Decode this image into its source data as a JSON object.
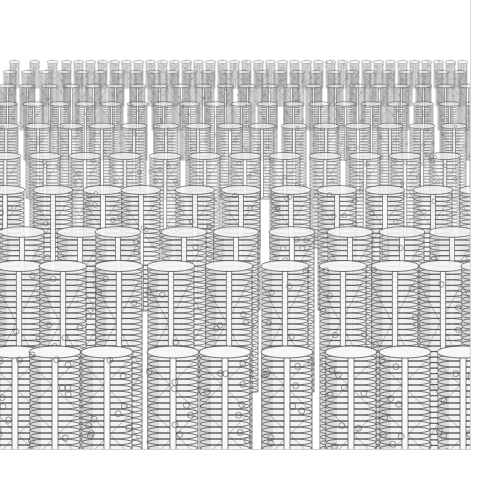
{
  "image": {
    "description": "Perspective field of helical pillar columns (rendered structural illustration)",
    "width": 504,
    "height": 492,
    "scene_bounds": {
      "x": 0,
      "y": 0,
      "width": 471,
      "height": 450
    },
    "background": "#ffffff",
    "frame_color": "#d0d0d0"
  },
  "scene": {
    "horizon_y": 62,
    "vanishing_x": 235,
    "stroke_color": "#3a3a3a",
    "light_fill": "#f2f2f2",
    "shadow_fill": "#cfcfcf",
    "bead_color": "#555555",
    "rows": [
      {
        "y_top": 62,
        "height": 26,
        "width": 9,
        "opacity": 0.45,
        "xs": [
          10,
          30,
          48,
          62,
          74,
          86,
          98,
          110,
          122,
          134,
          146,
          158,
          170,
          182,
          194,
          206,
          218,
          230,
          242,
          254,
          266,
          278,
          290,
          302,
          314,
          326,
          338,
          350,
          362,
          374,
          386,
          398,
          410,
          422,
          434,
          446,
          458
        ]
      },
      {
        "y_top": 72,
        "height": 34,
        "width": 12,
        "opacity": 0.5,
        "xs": [
          4,
          22,
          40,
          58,
          76,
          94,
          112,
          130,
          148,
          166,
          184,
          202,
          220,
          238,
          256,
          274,
          292,
          310,
          328,
          346,
          364,
          382,
          400,
          418,
          436,
          454
        ]
      },
      {
        "y_top": 86,
        "height": 44,
        "width": 15,
        "opacity": 0.55,
        "xs": [
          0,
          20,
          42,
          64,
          86,
          108,
          130,
          152,
          174,
          196,
          218,
          240,
          262,
          284,
          306,
          328,
          350,
          372,
          394,
          416,
          438,
          460
        ]
      },
      {
        "y_top": 104,
        "height": 56,
        "width": 19,
        "opacity": 0.6,
        "xs": [
          -2,
          24,
          50,
          76,
          102,
          128,
          154,
          180,
          206,
          232,
          258,
          284,
          310,
          336,
          362,
          388,
          414,
          440,
          466
        ]
      },
      {
        "y_top": 126,
        "height": 72,
        "width": 24,
        "opacity": 0.65,
        "xs": [
          -6,
          26,
          58,
          90,
          122,
          154,
          186,
          218,
          250,
          282,
          314,
          346,
          378,
          410,
          442
        ]
      },
      {
        "y_top": 156,
        "height": 92,
        "width": 30,
        "opacity": 0.72,
        "xs": [
          -10,
          30,
          70,
          110,
          150,
          190,
          230,
          270,
          310,
          350,
          390,
          430,
          470
        ]
      },
      {
        "y_top": 190,
        "height": 120,
        "width": 38,
        "opacity": 0.8,
        "xs": [
          -14,
          34,
          84,
          122,
          176,
          222,
          272,
          318,
          366,
          414,
          460
        ]
      },
      {
        "y_top": 232,
        "height": 160,
        "width": 44,
        "opacity": 0.86,
        "xs": [
          0,
          58,
          96,
          162,
          214,
          270,
          328,
          380,
          430
        ]
      },
      {
        "y_top": 266,
        "height": 190,
        "width": 46,
        "opacity": 0.92,
        "xs": [
          -4,
          40,
          96,
          148,
          206,
          262,
          320,
          372,
          420,
          462
        ]
      },
      {
        "y_top": 352,
        "height": 110,
        "width": 50,
        "opacity": 1.0,
        "xs": [
          -10,
          30,
          82,
          148,
          200,
          262,
          326,
          380,
          438
        ]
      }
    ],
    "column_style": {
      "coil_spacing": 6,
      "bead_radius_ratio": 0.06,
      "beads_per_column": 9,
      "central_rod_width_ratio": 0.12
    }
  }
}
